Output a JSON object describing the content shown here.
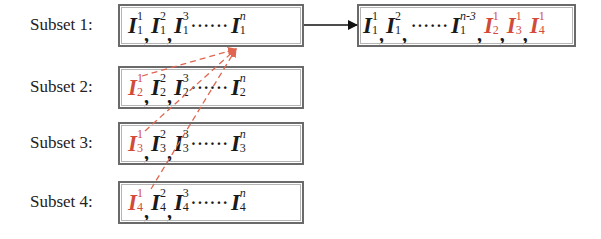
{
  "diagram": {
    "colors": {
      "text": "#1a1a1a",
      "highlight": "#d24b3a",
      "box_border": "#6a6a6a",
      "arrow": "#111111"
    },
    "subsets": [
      {
        "label": "Subset 1:",
        "terms": [
          {
            "base": "I",
            "sup": "1",
            "sub": "1",
            "highlight": false
          },
          {
            "sep": ","
          },
          {
            "base": "I",
            "sup": "2",
            "sub": "1",
            "highlight": false
          },
          {
            "sep": ","
          },
          {
            "base": "I",
            "sup": "3",
            "sub": "1",
            "highlight": false
          },
          {
            "dots": "······"
          },
          {
            "base": "I",
            "sup": "n",
            "sub": "1",
            "highlight": false
          }
        ]
      },
      {
        "label": "Subset 2:",
        "terms": [
          {
            "base": "I",
            "sup": "1",
            "sub": "2",
            "highlight": true
          },
          {
            "sep": ","
          },
          {
            "base": "I",
            "sup": "2",
            "sub": "2",
            "highlight": false
          },
          {
            "sep": ","
          },
          {
            "base": "I",
            "sup": "3",
            "sub": "2",
            "highlight": false
          },
          {
            "dots": "······"
          },
          {
            "base": "I",
            "sup": "n",
            "sub": "2",
            "highlight": false
          }
        ]
      },
      {
        "label": "Subset 3:",
        "terms": [
          {
            "base": "I",
            "sup": "1",
            "sub": "3",
            "highlight": true
          },
          {
            "sep": ","
          },
          {
            "base": "I",
            "sup": "2",
            "sub": "3",
            "highlight": false
          },
          {
            "sep": ","
          },
          {
            "base": "I",
            "sup": "3",
            "sub": "3",
            "highlight": false
          },
          {
            "dots": "······"
          },
          {
            "base": "I",
            "sup": "n",
            "sub": "3",
            "highlight": false
          }
        ]
      },
      {
        "label": "Subset 4:",
        "terms": [
          {
            "base": "I",
            "sup": "1",
            "sub": "4",
            "highlight": true
          },
          {
            "sep": ","
          },
          {
            "base": "I",
            "sup": "2",
            "sub": "4",
            "highlight": false
          },
          {
            "sep": ","
          },
          {
            "base": "I",
            "sup": "3",
            "sub": "4",
            "highlight": false
          },
          {
            "dots": "······"
          },
          {
            "base": "I",
            "sup": "n",
            "sub": "4",
            "highlight": false
          }
        ]
      }
    ],
    "result": {
      "terms": [
        {
          "base": "I",
          "sup": "1",
          "sub": "1",
          "highlight": false
        },
        {
          "sep": ","
        },
        {
          "base": "I",
          "sup": "2",
          "sub": "1",
          "highlight": false
        },
        {
          "sep": ","
        },
        {
          "dots": "······"
        },
        {
          "base": "I",
          "sup": "n-3",
          "sub": "1",
          "highlight": false
        },
        {
          "sep": ","
        },
        {
          "base": "I",
          "sup": "1",
          "sub": "2",
          "highlight": true
        },
        {
          "sep": ","
        },
        {
          "base": "I",
          "sup": "1",
          "sub": "3",
          "highlight": true
        },
        {
          "sep": ","
        },
        {
          "base": "I",
          "sup": "1",
          "sub": "4",
          "highlight": true
        }
      ]
    },
    "connections": [
      {
        "from": "subset-1-box",
        "to": "result-box",
        "style": "solid-arrow"
      },
      {
        "from": "subset-2-term-I2^1",
        "to": "subset-1-box",
        "style": "dashed-red-arrow"
      },
      {
        "from": "subset-3-term-I3^1",
        "to": "subset-1-box",
        "style": "dashed-red-arrow"
      },
      {
        "from": "subset-4-term-I4^1",
        "to": "subset-1-box",
        "style": "dashed-red-arrow"
      }
    ]
  }
}
